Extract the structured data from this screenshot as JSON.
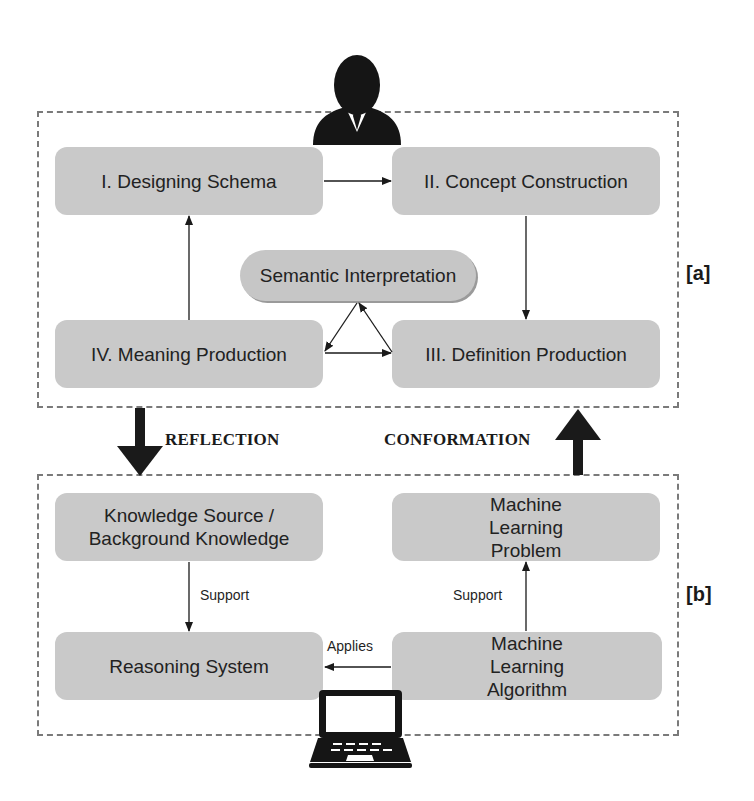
{
  "diagram": {
    "top_panel": {
      "tag": "[a]",
      "nodes": {
        "designing_schema": "I. Designing Schema",
        "concept_construction": "II. Concept Construction",
        "semantic_interpretation": "Semantic Interpretation",
        "meaning_production": "IV. Meaning Production",
        "definition_production": "III. Definition Production"
      }
    },
    "bottom_panel": {
      "tag": "[b]",
      "nodes": {
        "knowledge_source": "Knowledge Source / Background Knowledge",
        "ml_problem": "Machine Learning Problem",
        "reasoning_system": "Reasoning System",
        "ml_algorithm": "Machine Learning Algorithm"
      },
      "edge_labels": {
        "support_left": "Support",
        "support_right": "Support",
        "applies": "Applies"
      }
    },
    "flows": {
      "reflection": "REFLECTION",
      "conformation": "CONFORMATION"
    },
    "icons": {
      "top": "person-icon",
      "bottom": "laptop-icon"
    },
    "colors": {
      "node_fill": "#c9c9c9",
      "dashed_border": "#7a7a7a",
      "ink": "#1a1a1a"
    }
  }
}
